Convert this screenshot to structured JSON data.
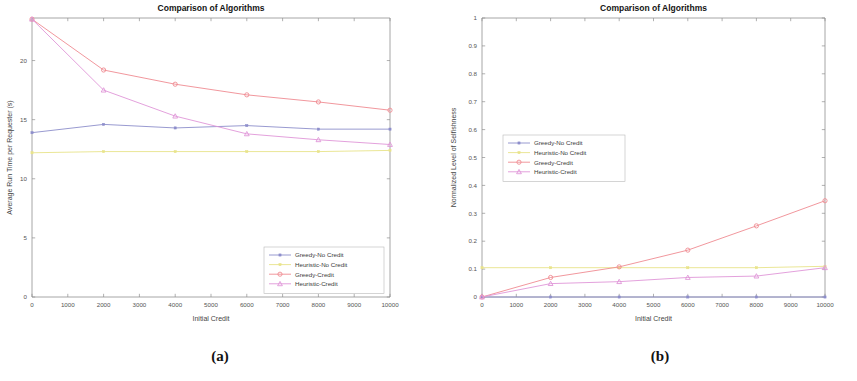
{
  "figure": {
    "captions": [
      {
        "id": "a",
        "text": "(a)"
      },
      {
        "id": "b",
        "text": "(b)"
      }
    ]
  },
  "colors": {
    "greedy_no_credit": "#8d8ecb",
    "heuristic_no_credit": "#e8e38a",
    "greedy_credit": "#ef8b92",
    "heuristic_credit": "#e096d8",
    "axis": "#8f8f8f",
    "title": "#141414"
  },
  "panel_a": {
    "title": "Comparison of Algorithms",
    "xlabel": "Initial Credit",
    "ylabel": "Average Run Time per Requester (s)"
  },
  "panel_b": {
    "title": "Comparison of Algorithms",
    "xlabel": "Initial Credit",
    "ylabel": "Normalized Level of Selfishness"
  },
  "chart_data": [
    {
      "type": "line",
      "id": "panel-a",
      "title": "Comparison of Algorithms",
      "xlabel": "Initial Credit",
      "ylabel": "Average Run Time per Requester (s)",
      "x": [
        0,
        2000,
        4000,
        6000,
        8000,
        10000
      ],
      "xlim": [
        0,
        10000
      ],
      "ylim": [
        0,
        23.6
      ],
      "xticks": [
        0,
        1000,
        2000,
        3000,
        4000,
        5000,
        6000,
        7000,
        8000,
        9000,
        10000
      ],
      "xticklabels": [
        "0",
        "1000",
        "2000",
        "3000",
        "4000",
        "5000",
        "6000",
        "7000",
        "8000",
        "9000",
        "10000"
      ],
      "yticks": [
        0,
        5,
        10,
        15,
        20
      ],
      "yticklabels": [
        "0",
        "5",
        "10",
        "15",
        "20"
      ],
      "grid": false,
      "legend_position": "lower-right",
      "series": [
        {
          "name": "Greedy-No Credit",
          "color": "#8d8ecb",
          "marker": "dot",
          "values": [
            13.9,
            14.6,
            14.3,
            14.5,
            14.2,
            14.2
          ]
        },
        {
          "name": "Heuristic-No Credit",
          "color": "#e8e38a",
          "marker": "dot",
          "values": [
            12.2,
            12.3,
            12.3,
            12.3,
            12.3,
            12.4
          ]
        },
        {
          "name": "Greedy-Credit",
          "color": "#ef8b92",
          "marker": "circle",
          "values": [
            23.5,
            19.2,
            18.0,
            17.1,
            16.5,
            15.8
          ]
        },
        {
          "name": "Heuristic-Credit",
          "color": "#e096d8",
          "marker": "triangle",
          "values": [
            23.5,
            17.5,
            15.3,
            13.8,
            13.3,
            12.9
          ]
        }
      ]
    },
    {
      "type": "line",
      "id": "panel-b",
      "title": "Comparison of Algorithms",
      "xlabel": "Initial Credit",
      "ylabel": "Normalized Level of Selfishness",
      "x": [
        0,
        2000,
        4000,
        6000,
        8000,
        10000
      ],
      "xlim": [
        0,
        10000
      ],
      "ylim": [
        0,
        1
      ],
      "xticks": [
        0,
        1000,
        2000,
        3000,
        4000,
        5000,
        6000,
        7000,
        8000,
        9000,
        10000
      ],
      "xticklabels": [
        "0",
        "1000",
        "2000",
        "3000",
        "4000",
        "5000",
        "6000",
        "7000",
        "8000",
        "9000",
        "10000"
      ],
      "yticks": [
        0,
        0.1,
        0.2,
        0.3,
        0.4,
        0.5,
        0.6,
        0.7,
        0.8,
        0.9,
        1
      ],
      "yticklabels": [
        "0",
        "0.1",
        "0.2",
        "0.3",
        "0.4",
        "0.5",
        "0.6",
        "0.7",
        "0.8",
        "0.9",
        "1"
      ],
      "grid": false,
      "legend_position": "middle-left",
      "series": [
        {
          "name": "Greedy-No Credit",
          "color": "#8d8ecb",
          "marker": "dot",
          "values": [
            0.0,
            0.0,
            0.0,
            0.0,
            0.0,
            0.0
          ]
        },
        {
          "name": "Heuristic-No Credit",
          "color": "#e8e38a",
          "marker": "dot",
          "values": [
            0.105,
            0.105,
            0.105,
            0.105,
            0.105,
            0.11
          ]
        },
        {
          "name": "Greedy-Credit",
          "color": "#ef8b92",
          "marker": "circle",
          "values": [
            0.0,
            0.07,
            0.108,
            0.168,
            0.255,
            0.345
          ]
        },
        {
          "name": "Heuristic-Credit",
          "color": "#e096d8",
          "marker": "triangle",
          "values": [
            0.0,
            0.048,
            0.055,
            0.07,
            0.075,
            0.105
          ]
        }
      ]
    }
  ]
}
